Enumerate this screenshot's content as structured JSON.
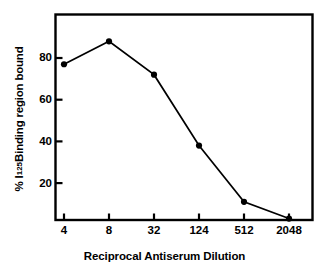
{
  "chart_data": {
    "type": "line",
    "title": "",
    "subtitle": "",
    "xlabel": "Reciprocal Antiserum Dilution",
    "ylabel": "% I125 Binding region bound",
    "ylabel_parts": {
      "percent": "%",
      "isotope_symbol": "I",
      "isotope_mass": "125",
      "rest": "Binding region bound"
    },
    "categories": [
      "4",
      "8",
      "32",
      "124",
      "512",
      "2048"
    ],
    "x_tick_labels": [
      "4",
      "8",
      "32",
      "124",
      "512",
      "2048"
    ],
    "y_tick_labels": [
      "20",
      "40",
      "60",
      "80"
    ],
    "y_ticks": [
      20,
      40,
      60,
      80
    ],
    "values": [
      77,
      88,
      72,
      38,
      11,
      3
    ],
    "series": [
      {
        "name": "Binding",
        "values": [
          77,
          88,
          72,
          38,
          11,
          3
        ]
      }
    ],
    "ylim": [
      0,
      94
    ],
    "xlim": [
      0,
      5
    ],
    "grid": false,
    "legend": "none",
    "marker": "filled-circle",
    "line_color": "#000000",
    "marker_color": "#000000",
    "frame_color": "#000000",
    "background_color": "#ffffff"
  }
}
